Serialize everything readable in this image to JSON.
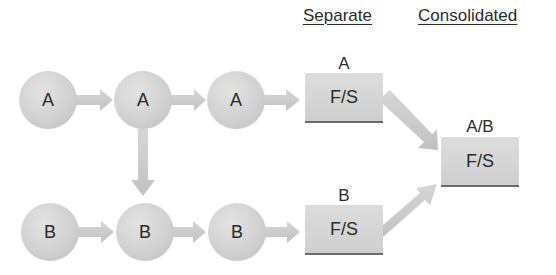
{
  "headers": {
    "separate": "Separate",
    "consolidated": "Consolidated"
  },
  "row_a": {
    "nodes": [
      "A",
      "A",
      "A"
    ]
  },
  "row_b": {
    "nodes": [
      "B",
      "B",
      "B"
    ]
  },
  "separate_statements": {
    "a": {
      "label": "A",
      "text": "F/S"
    },
    "b": {
      "label": "B",
      "text": "F/S"
    }
  },
  "consolidated_statement": {
    "label": "A/B",
    "text": "F/S"
  },
  "colors": {
    "node_fill": "#d2d2d2",
    "arrow_fill": "#cbcbcb",
    "box_fill": "#d6d6d6",
    "box_border": "#6b6b6b",
    "text": "#2a2a2a"
  }
}
